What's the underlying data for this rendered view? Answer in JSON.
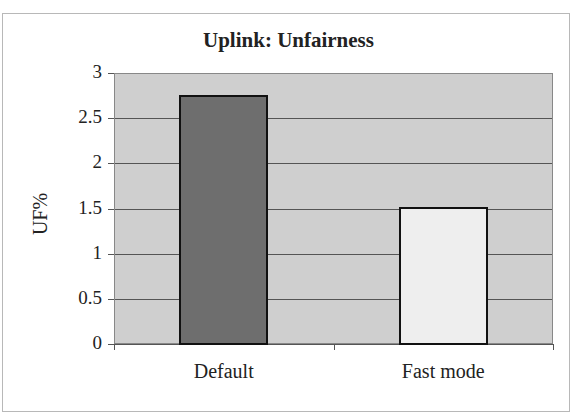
{
  "chart_data": {
    "type": "bar",
    "title": "Uplink: Unfairness",
    "xlabel": "",
    "ylabel": "UF%",
    "categories": [
      "Default",
      "Fast mode"
    ],
    "values": [
      2.76,
      1.52
    ],
    "bar_colors": [
      "#6e6e6e",
      "#eeeeee"
    ],
    "ylim": [
      0,
      3
    ],
    "yticks": [
      "0",
      "0.5",
      "1",
      "1.5",
      "2",
      "2.5",
      "3"
    ],
    "grid": true,
    "legend": null,
    "plot_background": "#cfcfcf"
  }
}
